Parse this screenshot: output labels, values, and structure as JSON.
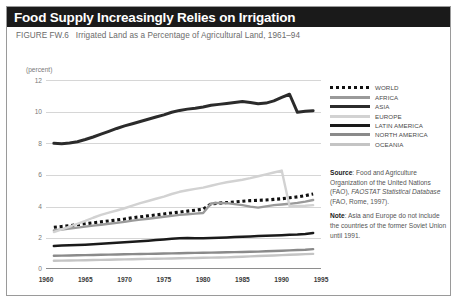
{
  "title": "Food Supply Increasingly Relies on Irrigation",
  "subtitle_figure": "FIGURE FW.6",
  "subtitle_text": "Irrigated Land as a Percentage of Agricultural Land, 1961–94",
  "axis_unit_label": "(percent)",
  "legend": {
    "items": [
      {
        "label": "WORLD",
        "style": "dotted",
        "color": "#111111"
      },
      {
        "label": "AFRICA",
        "style": "solid",
        "color": "#9a9a9a"
      },
      {
        "label": "ASIA",
        "style": "solid",
        "color": "#2b2b2b"
      },
      {
        "label": "EUROPE",
        "style": "solid",
        "color": "#d2d2d2"
      },
      {
        "label": "LATIN AMERICA",
        "style": "solid",
        "color": "#1a1a1a"
      },
      {
        "label": "NORTH AMERICA",
        "style": "solid",
        "color": "#8a8a8a"
      },
      {
        "label": "OCEANIA",
        "style": "solid",
        "color": "#c4c4c4"
      }
    ]
  },
  "notes": {
    "source_label": "Source",
    "source_text": ": Food and Agriculture Organization of the United Nations (FAO), ",
    "source_italic": "FAOSTAT Statistical Database",
    "source_tail": " (FAO, Rome, 1997).",
    "note_label": "Note",
    "note_text": ": Asia and Europe do not include the countries of the former Soviet Union until 1991."
  },
  "chart_data": {
    "type": "line",
    "title": "Irrigated Land as a Percentage of Agricultural Land, 1961–94",
    "xlabel": "",
    "ylabel": "(percent)",
    "xlim": [
      1960,
      1995
    ],
    "ylim": [
      0,
      12
    ],
    "yticks": [
      0,
      2,
      4,
      6,
      8,
      10,
      12
    ],
    "xticks": [
      1960,
      1965,
      1970,
      1975,
      1980,
      1985,
      1990,
      1995
    ],
    "grid": true,
    "legend_position": "right",
    "x": [
      1961,
      1962,
      1963,
      1964,
      1965,
      1966,
      1967,
      1968,
      1969,
      1970,
      1971,
      1972,
      1973,
      1974,
      1975,
      1976,
      1977,
      1978,
      1979,
      1980,
      1981,
      1982,
      1983,
      1984,
      1985,
      1986,
      1987,
      1988,
      1989,
      1990,
      1991,
      1992,
      1993,
      1994
    ],
    "series": [
      {
        "name": "WORLD",
        "color": "#111111",
        "style": "dotted",
        "values": [
          2.7,
          2.75,
          2.8,
          2.86,
          2.92,
          2.98,
          3.04,
          3.1,
          3.16,
          3.22,
          3.3,
          3.36,
          3.42,
          3.48,
          3.54,
          3.6,
          3.66,
          3.72,
          3.78,
          3.84,
          4.18,
          4.22,
          4.26,
          4.3,
          4.34,
          4.38,
          4.4,
          4.42,
          4.46,
          4.5,
          4.56,
          4.62,
          4.7,
          4.8
        ]
      },
      {
        "name": "AFRICA",
        "color": "#9a9a9a",
        "style": "solid",
        "values": [
          2.5,
          2.56,
          2.62,
          2.68,
          2.74,
          2.8,
          2.86,
          2.92,
          2.98,
          3.04,
          3.12,
          3.18,
          3.24,
          3.3,
          3.36,
          3.42,
          3.48,
          3.52,
          3.56,
          3.6,
          4.2,
          4.24,
          4.22,
          4.16,
          4.1,
          4.0,
          3.94,
          4.02,
          4.1,
          4.14,
          4.18,
          4.24,
          4.32,
          4.42
        ]
      },
      {
        "name": "ASIA",
        "color": "#2b2b2b",
        "style": "solid",
        "values": [
          8.0,
          7.98,
          8.02,
          8.1,
          8.24,
          8.4,
          8.58,
          8.76,
          8.94,
          9.1,
          9.24,
          9.38,
          9.52,
          9.66,
          9.8,
          9.96,
          10.08,
          10.16,
          10.22,
          10.3,
          10.4,
          10.46,
          10.52,
          10.58,
          10.64,
          10.58,
          10.5,
          10.54,
          10.68,
          10.9,
          11.1,
          9.96,
          10.02,
          10.06
        ]
      },
      {
        "name": "EUROPE",
        "color": "#d2d2d2",
        "style": "solid",
        "values": [
          2.4,
          2.56,
          2.74,
          2.92,
          3.1,
          3.3,
          3.48,
          3.62,
          3.76,
          3.9,
          4.06,
          4.22,
          4.36,
          4.5,
          4.64,
          4.8,
          4.94,
          5.04,
          5.12,
          5.2,
          5.32,
          5.44,
          5.54,
          5.62,
          5.7,
          5.8,
          5.92,
          6.04,
          6.16,
          6.28,
          4.02,
          4.04,
          4.06,
          4.1
        ]
      },
      {
        "name": "LATIN AMERICA",
        "color": "#1a1a1a",
        "style": "solid",
        "values": [
          1.52,
          1.54,
          1.56,
          1.58,
          1.6,
          1.63,
          1.66,
          1.69,
          1.72,
          1.75,
          1.78,
          1.81,
          1.85,
          1.89,
          1.93,
          1.97,
          2.0,
          2.02,
          2.01,
          2.0,
          2.02,
          2.04,
          2.06,
          2.08,
          2.1,
          2.12,
          2.14,
          2.16,
          2.18,
          2.2,
          2.22,
          2.24,
          2.28,
          2.34
        ]
      },
      {
        "name": "NORTH AMERICA",
        "color": "#8a8a8a",
        "style": "solid",
        "values": [
          0.9,
          0.91,
          0.92,
          0.93,
          0.94,
          0.95,
          0.96,
          0.97,
          0.98,
          0.99,
          1.0,
          1.01,
          1.02,
          1.03,
          1.04,
          1.05,
          1.06,
          1.07,
          1.08,
          1.09,
          1.1,
          1.11,
          1.12,
          1.13,
          1.14,
          1.15,
          1.16,
          1.18,
          1.2,
          1.22,
          1.24,
          1.26,
          1.28,
          1.32
        ]
      },
      {
        "name": "OCEANIA",
        "color": "#c4c4c4",
        "style": "solid",
        "values": [
          0.58,
          0.59,
          0.6,
          0.61,
          0.62,
          0.63,
          0.64,
          0.65,
          0.66,
          0.67,
          0.68,
          0.69,
          0.7,
          0.71,
          0.72,
          0.73,
          0.74,
          0.75,
          0.76,
          0.77,
          0.78,
          0.79,
          0.8,
          0.82,
          0.84,
          0.86,
          0.88,
          0.9,
          0.92,
          0.94,
          0.96,
          0.98,
          1.0,
          1.02
        ]
      }
    ]
  }
}
